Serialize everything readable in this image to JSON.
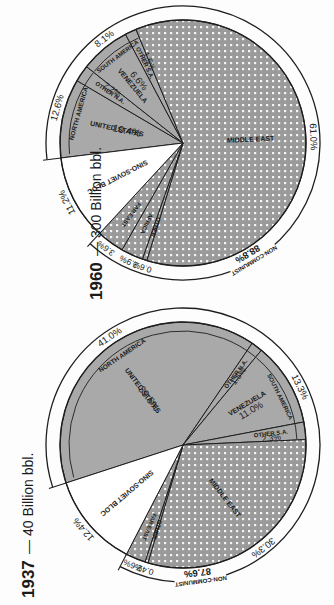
{
  "colors": {
    "us_fill": "#a9a9a9",
    "dotted_fill": "#9a9a9a",
    "dot": "#f4f4f4",
    "white_fill": "#ffffff",
    "stroke": "#1e1e1e",
    "background": "#fdfdfd"
  },
  "chart_data": [
    {
      "type": "pie",
      "title": "1937 — 40 Billion bbl.",
      "year": "1937",
      "subtitle": "40 Billion bbl.",
      "slices": [
        {
          "label": "United States",
          "value": 39.5,
          "group": "North America",
          "fill": "gray"
        },
        {
          "label": "Other N.A.",
          "value": 1.5,
          "group": "North America",
          "fill": "gray"
        },
        {
          "label": "Venezuela",
          "value": 11.0,
          "group": "South America",
          "fill": "gray"
        },
        {
          "label": "Other S.A.",
          "value": 2.3,
          "group": "South America",
          "fill": "gray"
        },
        {
          "label": "Middle East",
          "value": 30.3,
          "group": "Non-Communist",
          "fill": "dotted"
        },
        {
          "label": "Other",
          "value": 0.4,
          "group": "Non-Communist",
          "fill": "dotted"
        },
        {
          "label": "Far East",
          "value": 2.6,
          "group": "Non-Communist",
          "fill": "dotted"
        },
        {
          "label": "Sino-Soviet Bloc",
          "value": 12.4,
          "group": "Communist",
          "fill": "white"
        }
      ],
      "group_totals": [
        {
          "label": "North America",
          "value": 41.0
        },
        {
          "label": "South America",
          "value": 13.3
        },
        {
          "label": "Non-Communist",
          "value": 87.6
        }
      ]
    },
    {
      "type": "pie",
      "title": "1960 — 300 Billion bbl.",
      "year": "1960",
      "subtitle": "300 Billion bbl.",
      "slices": [
        {
          "label": "United States",
          "value": 10.4,
          "group": "North America",
          "fill": "gray"
        },
        {
          "label": "Other N.A.",
          "value": 2.2,
          "group": "North America",
          "fill": "gray"
        },
        {
          "label": "Venezuela",
          "value": 6.6,
          "group": "South America",
          "fill": "gray"
        },
        {
          "label": "Other S.A.",
          "value": 1.5,
          "group": "South America",
          "fill": "gray"
        },
        {
          "label": "Middle East",
          "value": 61.0,
          "group": "Non-Communist",
          "fill": "dotted"
        },
        {
          "label": "Other",
          "value": 0.6,
          "group": "Non-Communist",
          "fill": "dotted"
        },
        {
          "label": "Africa",
          "value": 2.9,
          "group": "Non-Communist",
          "fill": "dotted"
        },
        {
          "label": "Far East",
          "value": 3.6,
          "group": "Non-Communist",
          "fill": "dotted"
        },
        {
          "label": "Sino-Soviet Bloc",
          "value": 11.2,
          "group": "Communist",
          "fill": "white"
        }
      ],
      "group_totals": [
        {
          "label": "North America",
          "value": 12.6
        },
        {
          "label": "South America",
          "value": 8.1
        },
        {
          "label": "Non-Communist",
          "value": 88.8
        }
      ]
    }
  ],
  "pies": {
    "p1937": {
      "year": "1937",
      "dash": "—",
      "subtitle": "40 Billion bbl.",
      "cx": 183,
      "cy": 445,
      "r": 123,
      "ring": 137,
      "start": 162,
      "labels": {
        "us": "UNITED STATES",
        "us_pct": "39.5%",
        "other_na": "OTHER N.A.",
        "other_na_pct": "1.5%",
        "venezuela": "VENEZUELA",
        "venezuela_pct": "11.0%",
        "other_sa": "OTHER S.A.",
        "other_sa_pct": "2.3%",
        "middle_east": "MIDDLE EAST",
        "other": "OTHER",
        "far_east": "FAR EAST",
        "sino_soviet": "SINO-SOVIET BLOC",
        "north_america": "NORTH AMERICA",
        "north_america_pct": "41.0%",
        "south_america": "SOUTH AMERICA",
        "south_america_pct": "13.3%",
        "non_communist": "NON-COMMUNIST",
        "non_communist_pct": "87.6%",
        "middle_east_pct": "30.3%",
        "sino_pct": "12.4%",
        "far_east_pct": "2.6%",
        "other_pct": "0.4%"
      }
    },
    "p1960": {
      "year": "1960",
      "dash": "—",
      "subtitle": "300 Billion bbl.",
      "cx": 183,
      "cy": 143,
      "r": 123,
      "ring": 137,
      "start": 173,
      "labels": {
        "us": "UNITED STATES",
        "us_pct": "10.4%",
        "other_na": "OTHER N.A.",
        "other_na_pct": "2.2%",
        "venezuela": "VENEZUELA",
        "venezuela_pct": "6.6%",
        "other_sa": "OTHER S.A.",
        "other_sa_pct": "1.5%",
        "middle_east": "MIDDLE EAST",
        "other": "OTHER",
        "africa": "AFRICA",
        "far_east": "FAR EAST",
        "sino_soviet": "SINO-SOVIET BLOC",
        "north_america": "NORTH AMERICA",
        "north_america_pct": "12.6%",
        "south_america": "SOUTH AMERICA",
        "south_america_pct": "8.1%",
        "non_communist": "NON-COMMUNIST",
        "non_communist_pct": "88.8%",
        "middle_east_pct": "61.0%",
        "sino_pct": "11.2%",
        "far_east_pct": "3.6%",
        "africa_pct": "2.9%",
        "other_pct": "0.6%"
      }
    }
  }
}
